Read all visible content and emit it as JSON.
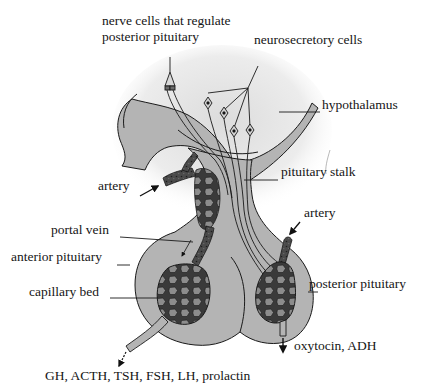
{
  "diagram": {
    "colors": {
      "tissue_fill": "#b4b4b4",
      "halo_fill": "#e6e6e6",
      "capillary_fill": "#3c3c3c",
      "capillary_cell": "#8a8a8a",
      "outline": "#1a1a1a",
      "background": "#ffffff"
    },
    "labels": {
      "nerve_cells": [
        "nerve cells that regulate",
        "posterior pituitary"
      ],
      "neurosecretory": "neurosecretory cells",
      "hypothalamus": "hypothalamus",
      "artery_left": "artery",
      "pituitary_stalk": "pituitary stalk",
      "portal_vein": "portal vein",
      "artery_right": "artery",
      "anterior_pituitary": "anterior pituitary",
      "posterior_pituitary": "posterior pituitary",
      "capillary_bed": "capillary bed",
      "posterior_output": "oxytocin, ADH",
      "anterior_output": "GH, ACTH, TSH, FSH, LH, prolactin"
    }
  }
}
